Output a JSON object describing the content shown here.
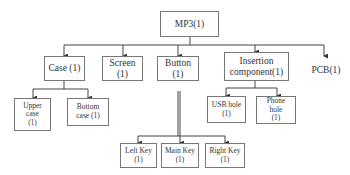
{
  "diagram": {
    "type": "tree",
    "root": "MP3(1)",
    "level1": [
      "Case (1)",
      "Screen (1)",
      "Button (1)",
      "Insertion component(1)",
      "PCB(1)"
    ],
    "case_children": [
      "Upper case (1)",
      "Bottom case (1)"
    ],
    "button_children": [
      "Left Key (1)",
      "Main Key (1)",
      "Right Key (1)"
    ],
    "insertion_children": [
      "USB hole (1)",
      "Phone hole (1)"
    ]
  },
  "nodes": {
    "root": "MP3(1)",
    "case": "Case (1)",
    "screen_l1": "Screen",
    "screen_l2": "(1)",
    "button_l1": "Button",
    "button_l2": "(1)",
    "insertion_l1": "Insertion",
    "insertion_l2": "component(1)",
    "pcb": "PCB(1)",
    "upper_l1": "Upper",
    "upper_l2": "case",
    "upper_l3": "(1)",
    "bottom_l1": "Bottom",
    "bottom_l2": "case (1)",
    "usb_l1": "USB hole",
    "usb_l2": "(1)",
    "phone_l1": "Phone",
    "phone_l2": "hole",
    "phone_l3": "(1)",
    "left_l1": "Left Key",
    "left_l2": "(1)",
    "main_l1": "Main Key",
    "main_l2": "(1)",
    "right_l1": "Right Key",
    "right_l2": "(1)"
  }
}
